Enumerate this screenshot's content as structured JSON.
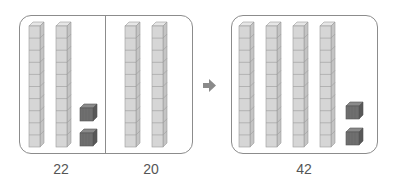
{
  "diagram": {
    "left_group": {
      "sections": [
        {
          "value_label": "22",
          "tens": 2,
          "ones": 2
        },
        {
          "value_label": "20",
          "tens": 2,
          "ones": 0
        }
      ]
    },
    "arrow": {
      "icon": "right-arrow-icon"
    },
    "right_group": {
      "value_label": "42",
      "tens": 4,
      "ones": 2
    },
    "colors": {
      "frame": "#8c8c8c",
      "rod_front": "#d6d6d6",
      "rod_side": "#c4c4c4",
      "rod_top": "#e6e6e6",
      "rod_line": "#9a9a9a",
      "unit_front": "#6f6f6f",
      "unit_side": "#585858",
      "unit_top": "#8a8a8a",
      "arrow": "#8a8a8a",
      "label": "#555555"
    }
  }
}
